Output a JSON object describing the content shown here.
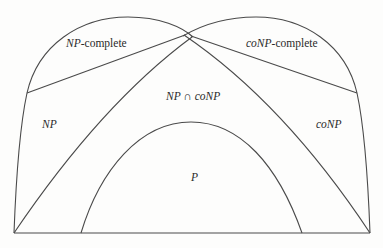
{
  "diagram": {
    "regions": {
      "np_complete": {
        "italic": "NP",
        "suffix": "-complete"
      },
      "conp_complete": {
        "italic": "coNP",
        "suffix": "-complete"
      },
      "np": {
        "italic": "NP"
      },
      "conp": {
        "italic": "coNP"
      },
      "intersection": {
        "left": "NP",
        "op": " ∩ ",
        "right": "coNP"
      },
      "p": {
        "italic": "P"
      }
    },
    "colors": {
      "stroke": "#4a4a4a",
      "text": "#2a2a2a",
      "background": "#fdfdfc"
    }
  }
}
